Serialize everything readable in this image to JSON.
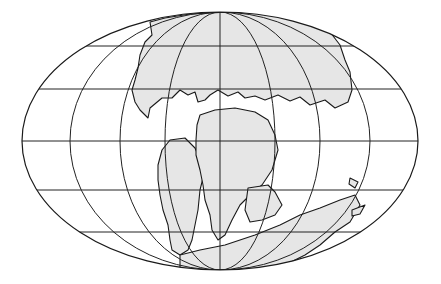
{
  "map": {
    "subject": "Pangaea supercontinent",
    "projection": "elliptical (Mollweide-like) world projection",
    "colors": {
      "background": "#ffffff",
      "land": "#e6e6e6",
      "outline": "#1a1a1a",
      "graticule": "#222222"
    },
    "ellipse": {
      "cx": 220,
      "cy": 141,
      "rx": 198,
      "ry": 129
    },
    "parallels_y": [
      40,
      89,
      141,
      190,
      235
    ],
    "meridian_rx": [
      0,
      55,
      100,
      150
    ]
  }
}
